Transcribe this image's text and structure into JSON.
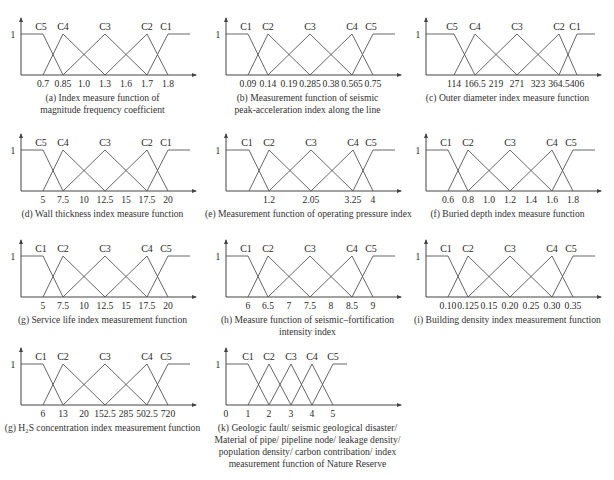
{
  "figure": {
    "panels": [
      {
        "id": "a",
        "left": 0,
        "top": 10,
        "caption": [
          "(a) Index measure function of",
          "magnitude frequency coefficient"
        ],
        "classes": [
          "C5",
          "C4",
          "C3",
          "C2",
          "C1"
        ],
        "ticks": [
          "0.7",
          "0.85",
          "1.0",
          "1.3",
          "1.6",
          "1.7",
          "1.8"
        ],
        "layout": "seven"
      },
      {
        "id": "b",
        "left": 205,
        "top": 10,
        "caption": [
          "(b) Measurement function of seismic",
          "peak-acceleration index along the line"
        ],
        "classes": [
          "C1",
          "C2",
          "C3",
          "C4",
          "C5"
        ],
        "ticks": [
          "0.09",
          "0.14",
          "0.19",
          "0.285",
          "0.38",
          "0.565",
          "0.75"
        ],
        "layout": "seven"
      },
      {
        "id": "c",
        "left": 405,
        "top": 10,
        "caption": [
          "(c)  Outer diameter index measure function"
        ],
        "classes": [
          "C5",
          "C4",
          "C3",
          "C2",
          "C1"
        ],
        "ticks": [
          "114",
          "166.5",
          "219",
          "271",
          "323",
          "364.5",
          "406"
        ],
        "layout": "seven"
      },
      {
        "id": "d",
        "left": 0,
        "top": 126,
        "caption": [
          "(d) Wall thickness index measure function"
        ],
        "classes": [
          "C5",
          "C4",
          "C3",
          "C2",
          "C1"
        ],
        "ticks": [
          "5",
          "7.5",
          "10",
          "12.5",
          "15",
          "17.5",
          "20"
        ],
        "layout": "seven"
      },
      {
        "id": "e",
        "left": 205,
        "top": 126,
        "caption": [
          "(e) Measurement function of operating pressure index"
        ],
        "classes": [
          "C1",
          "C2",
          "C3",
          "C4",
          "C5"
        ],
        "ticks": [
          "",
          "1.2",
          "",
          "2.05",
          "",
          "3.25",
          "4"
        ],
        "layout": "seven"
      },
      {
        "id": "f",
        "left": 405,
        "top": 126,
        "caption": [
          "(f) Buried depth index measure function"
        ],
        "classes": [
          "C1",
          "C2",
          "C3",
          "C4",
          "C5"
        ],
        "ticks": [
          "0.6",
          "0.8",
          "1.0",
          "1.2",
          "1.4",
          "1.6",
          "1.8"
        ],
        "layout": "seven"
      },
      {
        "id": "g",
        "left": 0,
        "top": 232,
        "caption": [
          "(g) Service life index measurement function"
        ],
        "classes": [
          "C1",
          "C2",
          "C3",
          "C4",
          "C5"
        ],
        "ticks": [
          "5",
          "7.5",
          "10",
          "12.5",
          "15",
          "17.5",
          "20"
        ],
        "layout": "seven"
      },
      {
        "id": "h",
        "left": 205,
        "top": 232,
        "caption": [
          "(h) Measure function of seismic–fortification",
          "intensity index"
        ],
        "classes": [
          "C1",
          "C2",
          "C3",
          "C4",
          "C5"
        ],
        "ticks": [
          "6",
          "6.5",
          "7",
          "7.5",
          "8",
          "8.5",
          "9"
        ],
        "layout": "seven"
      },
      {
        "id": "i",
        "left": 405,
        "top": 232,
        "caption": [
          "(i) Building density index measurement function"
        ],
        "classes": [
          "C1",
          "C2",
          "C3",
          "C4",
          "C5"
        ],
        "ticks": [
          "0.10",
          "0.125",
          "0.15",
          "0.20",
          "0.25",
          "0.30",
          "0.35"
        ],
        "layout": "seven"
      },
      {
        "id": "j",
        "left": 0,
        "top": 340,
        "caption": [
          "(g) H₂S concentration index measurement function"
        ],
        "classes": [
          "C1",
          "C2",
          "C3",
          "C4",
          "C5"
        ],
        "ticks": [
          "6",
          "13",
          "20",
          "152.5",
          "285",
          "502.5",
          "720"
        ],
        "layout": "seven"
      },
      {
        "id": "k",
        "left": 205,
        "top": 340,
        "caption": [
          "(k) Geologic fault/ seismic geological disaster/",
          "Material of pipe/ pipeline node/ leakage density/",
          "population density/ carbon contribation/ index",
          "measurement function of Nature Reserve"
        ],
        "classes": [
          "C1",
          "C2",
          "C3",
          "C4",
          "C5"
        ],
        "ticks": [
          "0",
          "1",
          "2",
          "3",
          "4",
          "5"
        ],
        "layout": "uniform"
      }
    ],
    "y_label": "1"
  },
  "chart_data": [
    {
      "type": "line",
      "title": "(a) Index measure function of magnitude frequency coefficient",
      "xlabel": "",
      "ylabel": "membership",
      "ylim": [
        0,
        1
      ],
      "x_ticks": [
        0.7,
        0.85,
        1.0,
        1.3,
        1.6,
        1.7,
        1.8
      ],
      "series": [
        {
          "name": "C5",
          "x": [
            0.7,
            0.85
          ],
          "values": [
            1,
            0
          ],
          "note": "1 for x<=0.7"
        },
        {
          "name": "C4",
          "x": [
            0.7,
            0.85,
            1.3
          ],
          "values": [
            0,
            1,
            0
          ]
        },
        {
          "name": "C3",
          "x": [
            0.85,
            1.3,
            1.7
          ],
          "values": [
            0,
            1,
            0
          ]
        },
        {
          "name": "C2",
          "x": [
            1.3,
            1.7,
            1.8
          ],
          "values": [
            0,
            1,
            0
          ]
        },
        {
          "name": "C1",
          "x": [
            1.7,
            1.8
          ],
          "values": [
            0,
            1
          ],
          "note": "1 for x>=1.8"
        }
      ]
    },
    {
      "type": "line",
      "title": "(b) Measurement function of seismic peak-acceleration index along the line",
      "ylim": [
        0,
        1
      ],
      "x_ticks": [
        0.09,
        0.14,
        0.19,
        0.285,
        0.38,
        0.565,
        0.75
      ],
      "series": [
        {
          "name": "C1",
          "x": [
            0.09,
            0.14
          ],
          "values": [
            1,
            0
          ]
        },
        {
          "name": "C2",
          "x": [
            0.09,
            0.14,
            0.285
          ],
          "values": [
            0,
            1,
            0
          ]
        },
        {
          "name": "C3",
          "x": [
            0.14,
            0.285,
            0.565
          ],
          "values": [
            0,
            1,
            0
          ]
        },
        {
          "name": "C4",
          "x": [
            0.285,
            0.565,
            0.75
          ],
          "values": [
            0,
            1,
            0
          ]
        },
        {
          "name": "C5",
          "x": [
            0.565,
            0.75
          ],
          "values": [
            0,
            1
          ]
        }
      ]
    },
    {
      "type": "line",
      "title": "(c) Outer diameter index measure function",
      "ylim": [
        0,
        1
      ],
      "x_ticks": [
        114,
        166.5,
        219,
        271,
        323,
        364.5,
        406
      ],
      "series": [
        {
          "name": "C5",
          "x": [
            114,
            166.5
          ],
          "values": [
            1,
            0
          ]
        },
        {
          "name": "C4",
          "x": [
            114,
            166.5,
            271
          ],
          "values": [
            0,
            1,
            0
          ]
        },
        {
          "name": "C3",
          "x": [
            166.5,
            271,
            364.5
          ],
          "values": [
            0,
            1,
            0
          ]
        },
        {
          "name": "C2",
          "x": [
            271,
            364.5,
            406
          ],
          "values": [
            0,
            1,
            0
          ]
        },
        {
          "name": "C1",
          "x": [
            364.5,
            406
          ],
          "values": [
            0,
            1
          ]
        }
      ]
    },
    {
      "type": "line",
      "title": "(d) Wall thickness index measure function",
      "ylim": [
        0,
        1
      ],
      "x_ticks": [
        5,
        7.5,
        10,
        12.5,
        15,
        17.5,
        20
      ],
      "series": [
        {
          "name": "C5",
          "x": [
            5,
            7.5
          ],
          "values": [
            1,
            0
          ]
        },
        {
          "name": "C4",
          "x": [
            5,
            7.5,
            12.5
          ],
          "values": [
            0,
            1,
            0
          ]
        },
        {
          "name": "C3",
          "x": [
            7.5,
            12.5,
            17.5
          ],
          "values": [
            0,
            1,
            0
          ]
        },
        {
          "name": "C2",
          "x": [
            12.5,
            17.5,
            20
          ],
          "values": [
            0,
            1,
            0
          ]
        },
        {
          "name": "C1",
          "x": [
            17.5,
            20
          ],
          "values": [
            0,
            1
          ]
        }
      ]
    },
    {
      "type": "line",
      "title": "(e) Measurement function of operating pressure index",
      "ylim": [
        0,
        1
      ],
      "x_ticks": [
        1.2,
        2.05,
        3.25,
        4
      ],
      "series": [
        {
          "name": "C1",
          "x": [
            null,
            1.2
          ],
          "values": [
            1,
            0
          ]
        },
        {
          "name": "C2",
          "x": [
            null,
            1.2,
            2.05
          ],
          "values": [
            0,
            1,
            0
          ]
        },
        {
          "name": "C3",
          "x": [
            1.2,
            2.05,
            3.25
          ],
          "values": [
            0,
            1,
            0
          ]
        },
        {
          "name": "C4",
          "x": [
            2.05,
            3.25,
            4
          ],
          "values": [
            0,
            1,
            0
          ]
        },
        {
          "name": "C5",
          "x": [
            3.25,
            4
          ],
          "values": [
            0,
            1
          ]
        }
      ]
    },
    {
      "type": "line",
      "title": "(f) Buried depth index measure function",
      "ylim": [
        0,
        1
      ],
      "x_ticks": [
        0.6,
        0.8,
        1.0,
        1.2,
        1.4,
        1.6,
        1.8
      ],
      "series": [
        {
          "name": "C1",
          "x": [
            0.6,
            0.8
          ],
          "values": [
            1,
            0
          ]
        },
        {
          "name": "C2",
          "x": [
            0.6,
            0.8,
            1.2
          ],
          "values": [
            0,
            1,
            0
          ]
        },
        {
          "name": "C3",
          "x": [
            0.8,
            1.2,
            1.6
          ],
          "values": [
            0,
            1,
            0
          ]
        },
        {
          "name": "C4",
          "x": [
            1.2,
            1.6,
            1.8
          ],
          "values": [
            0,
            1,
            0
          ]
        },
        {
          "name": "C5",
          "x": [
            1.6,
            1.8
          ],
          "values": [
            0,
            1
          ]
        }
      ]
    },
    {
      "type": "line",
      "title": "(g) Service life index measurement function",
      "ylim": [
        0,
        1
      ],
      "x_ticks": [
        5,
        7.5,
        10,
        12.5,
        15,
        17.5,
        20
      ],
      "series": [
        {
          "name": "C1",
          "x": [
            5,
            7.5
          ],
          "values": [
            1,
            0
          ]
        },
        {
          "name": "C2",
          "x": [
            5,
            7.5,
            12.5
          ],
          "values": [
            0,
            1,
            0
          ]
        },
        {
          "name": "C3",
          "x": [
            7.5,
            12.5,
            17.5
          ],
          "values": [
            0,
            1,
            0
          ]
        },
        {
          "name": "C4",
          "x": [
            12.5,
            17.5,
            20
          ],
          "values": [
            0,
            1,
            0
          ]
        },
        {
          "name": "C5",
          "x": [
            17.5,
            20
          ],
          "values": [
            0,
            1
          ]
        }
      ]
    },
    {
      "type": "line",
      "title": "(h) Measure function of seismic-fortification intensity index",
      "ylim": [
        0,
        1
      ],
      "x_ticks": [
        6,
        6.5,
        7,
        7.5,
        8,
        8.5,
        9
      ],
      "series": [
        {
          "name": "C1",
          "x": [
            6,
            6.5
          ],
          "values": [
            1,
            0
          ]
        },
        {
          "name": "C2",
          "x": [
            6,
            6.5,
            7.5
          ],
          "values": [
            0,
            1,
            0
          ]
        },
        {
          "name": "C3",
          "x": [
            6.5,
            7.5,
            8.5
          ],
          "values": [
            0,
            1,
            0
          ]
        },
        {
          "name": "C4",
          "x": [
            7.5,
            8.5,
            9
          ],
          "values": [
            0,
            1,
            0
          ]
        },
        {
          "name": "C5",
          "x": [
            8.5,
            9
          ],
          "values": [
            0,
            1
          ]
        }
      ]
    },
    {
      "type": "line",
      "title": "(i) Building density index measurement function",
      "ylim": [
        0,
        1
      ],
      "x_ticks": [
        0.1,
        0.125,
        0.15,
        0.2,
        0.25,
        0.3,
        0.35
      ],
      "series": [
        {
          "name": "C1",
          "x": [
            0.1,
            0.125
          ],
          "values": [
            1,
            0
          ]
        },
        {
          "name": "C2",
          "x": [
            0.1,
            0.125,
            0.2
          ],
          "values": [
            0,
            1,
            0
          ]
        },
        {
          "name": "C3",
          "x": [
            0.125,
            0.2,
            0.3
          ],
          "values": [
            0,
            1,
            0
          ]
        },
        {
          "name": "C4",
          "x": [
            0.2,
            0.3,
            0.35
          ],
          "values": [
            0,
            1,
            0
          ]
        },
        {
          "name": "C5",
          "x": [
            0.3,
            0.35
          ],
          "values": [
            0,
            1
          ]
        }
      ]
    },
    {
      "type": "line",
      "title": "(g) H2S concentration index measurement function",
      "ylim": [
        0,
        1
      ],
      "x_ticks": [
        6,
        13,
        20,
        152.5,
        285,
        502.5,
        720
      ],
      "series": [
        {
          "name": "C1",
          "x": [
            6,
            13
          ],
          "values": [
            1,
            0
          ]
        },
        {
          "name": "C2",
          "x": [
            6,
            13,
            152.5
          ],
          "values": [
            0,
            1,
            0
          ]
        },
        {
          "name": "C3",
          "x": [
            13,
            152.5,
            502.5
          ],
          "values": [
            0,
            1,
            0
          ]
        },
        {
          "name": "C4",
          "x": [
            152.5,
            502.5,
            720
          ],
          "values": [
            0,
            1,
            0
          ]
        },
        {
          "name": "C5",
          "x": [
            502.5,
            720
          ],
          "values": [
            0,
            1
          ]
        }
      ]
    },
    {
      "type": "line",
      "title": "(k) Geologic fault/ seismic geological disaster/ Material of pipe/ pipeline node/ leakage density/ population density/ carbon contribation/ index measurement function of Nature Reserve",
      "ylim": [
        0,
        1
      ],
      "x_ticks": [
        0,
        1,
        2,
        3,
        4,
        5
      ],
      "series": [
        {
          "name": "C1",
          "x": [
            1,
            2
          ],
          "values": [
            1,
            0
          ]
        },
        {
          "name": "C2",
          "x": [
            1,
            2,
            3
          ],
          "values": [
            0,
            1,
            0
          ]
        },
        {
          "name": "C3",
          "x": [
            2,
            3,
            4
          ],
          "values": [
            0,
            1,
            0
          ]
        },
        {
          "name": "C4",
          "x": [
            3,
            4,
            5
          ],
          "values": [
            0,
            1,
            0
          ]
        },
        {
          "name": "C5",
          "x": [
            4,
            5
          ],
          "values": [
            0,
            1
          ]
        }
      ]
    }
  ]
}
